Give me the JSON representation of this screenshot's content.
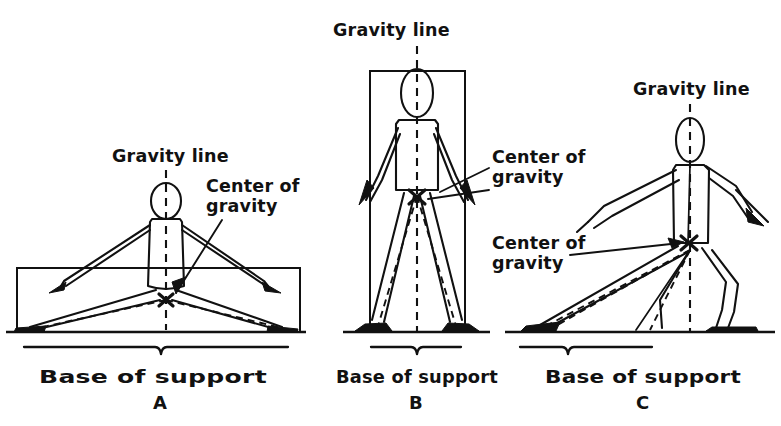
{
  "figure": {
    "background_color": "#ffffff",
    "ink_color": "#111111",
    "panel_count": 3
  },
  "panels": [
    {
      "id": "A",
      "letter": "A",
      "gravity_line_label": "Gravity line",
      "center_of_gravity_label": "Center of\ngravity",
      "center_of_gravity_label_line1": "Center of",
      "center_of_gravity_label_line2": "gravity",
      "base_of_support_label": "Base of support",
      "posture": "low wide straddle / seated-wide stance",
      "base_of_support_width_px": 250,
      "center_of_gravity_height_px": 56,
      "stability": "most stable - widest base, lowest center of gravity"
    },
    {
      "id": "B",
      "letter": "B",
      "gravity_line_label": "Gravity line",
      "center_of_gravity_label": "Center of\ngravity",
      "center_of_gravity_label_line1": "Center of",
      "center_of_gravity_label_line2": "gravity",
      "base_of_support_label": "Base of support",
      "posture": "erect standing, feet apart",
      "base_of_support_width_px": 70,
      "center_of_gravity_height_px": 128,
      "stability": "least stable - narrow base, high center of gravity"
    },
    {
      "id": "C",
      "letter": "C",
      "gravity_line_label": "Gravity line",
      "center_of_gravity_label": "Center of\ngravity",
      "center_of_gravity_label_line1": "Center of",
      "center_of_gravity_label_line2": "gravity",
      "base_of_support_label": "Base of support",
      "posture": "forward stride / lunge stance",
      "base_of_support_width_px": 95,
      "center_of_gravity_height_px": 88,
      "stability": "intermediate - forward base extension"
    }
  ]
}
